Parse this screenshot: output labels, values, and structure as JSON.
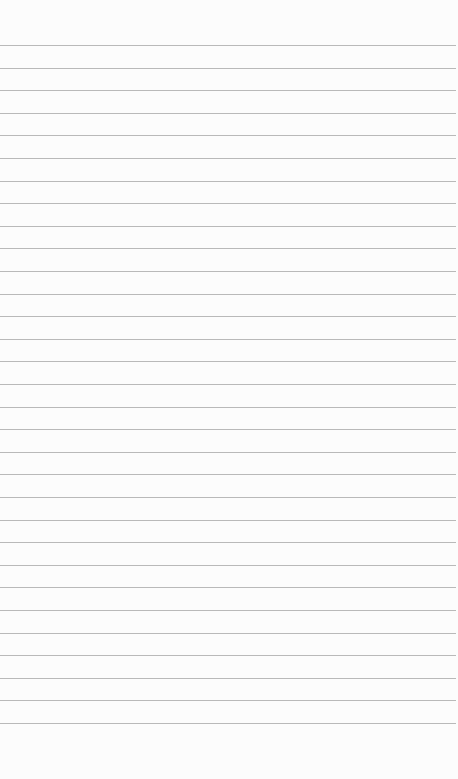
{
  "page": {
    "type": "lined-paper",
    "background_color": "#fcfcfc",
    "line_color": "#b9b9b9",
    "line_count": 31,
    "first_line_y": 45,
    "line_spacing": 22.6
  },
  "text_content": []
}
